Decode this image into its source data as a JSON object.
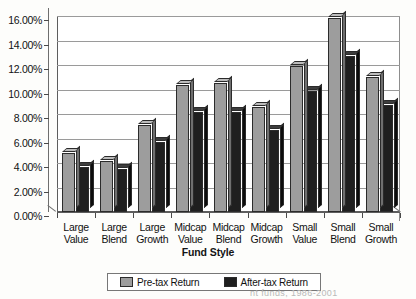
{
  "chart_data": {
    "type": "bar",
    "title": "",
    "xlabel": "Fund Style",
    "ylabel": "",
    "ylim": [
      0,
      16
    ],
    "ytick_labels": [
      "16.00%",
      "14.00%",
      "12.00%",
      "10.00%",
      "8.00%",
      "6.00%",
      "4.00%",
      "2.00%",
      "0.00%"
    ],
    "ytick_values": [
      16,
      14,
      12,
      10,
      8,
      6,
      4,
      2,
      0
    ],
    "grid": true,
    "legend_position": "bottom",
    "categories": [
      "Large Value",
      "Large Blend",
      "Large Growth",
      "Midcap Value",
      "Midcap Blend",
      "Midcap Growth",
      "Small Value",
      "Small Blend",
      "Small Growth"
    ],
    "category_lines": [
      [
        "Large",
        "Value"
      ],
      [
        "Large",
        "Blend"
      ],
      [
        "Large",
        "Growth"
      ],
      [
        "Midcap",
        "Value"
      ],
      [
        "Midcap",
        "Blend"
      ],
      [
        "Midcap",
        "Growth"
      ],
      [
        "Small",
        "Value"
      ],
      [
        "Small",
        "Blend"
      ],
      [
        "Small",
        "Growth"
      ]
    ],
    "series": [
      {
        "name": "Pre-tax Return",
        "color": "#9d9d9d",
        "values": [
          4.8,
          4.2,
          7.1,
          10.4,
          10.5,
          8.6,
          11.9,
          15.8,
          11.0
        ]
      },
      {
        "name": "After-tax Return",
        "color": "#1f1f1f",
        "values": [
          3.7,
          3.5,
          5.7,
          8.2,
          8.2,
          6.7,
          9.9,
          12.7,
          8.7
        ]
      }
    ]
  },
  "legend": {
    "entries": [
      {
        "label": "Pre-tax Return"
      },
      {
        "label": "After-tax Return"
      }
    ]
  },
  "caption": {
    "fragment": "nt funds, 1986-2001"
  }
}
